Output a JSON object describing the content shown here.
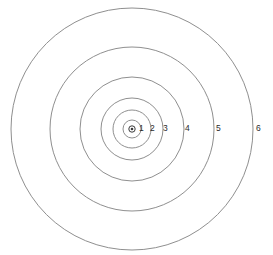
{
  "figure": {
    "background_color": "#ffffff",
    "width": 273,
    "height": 255
  },
  "style": {
    "ring_stroke_color": "#8f8f8f",
    "ring_stroke_width": 1,
    "ring_fill": "none",
    "label_color": "#2b2b2b",
    "label_font_size": 8.5,
    "center_marker_color": "#3a3a3a",
    "center_marker_fill": "#ffffff"
  },
  "chart_data": {
    "type": "scatter",
    "title": "",
    "subtitle": "",
    "xlabel": "",
    "ylabel": "",
    "grid": false,
    "legend_position": "none",
    "center": {
      "x": 132,
      "y": 129
    },
    "center_marker": {
      "label": "center-point",
      "outer_radius": 3.2,
      "inner_radius": 1.3
    },
    "rings": [
      {
        "label": "1",
        "radius": 9,
        "label_x": 139,
        "label_y": 129
      },
      {
        "label": "2",
        "radius": 19,
        "label_x": 150,
        "label_y": 129
      },
      {
        "label": "3",
        "radius": 31,
        "label_x": 163,
        "label_y": 129
      },
      {
        "label": "4",
        "radius": 52,
        "label_x": 185,
        "label_y": 129
      },
      {
        "label": "5",
        "radius": 82,
        "label_x": 216,
        "label_y": 129
      },
      {
        "label": "6",
        "radius": 121,
        "label_x": 256,
        "label_y": 129
      }
    ],
    "categories": [
      "1",
      "2",
      "3",
      "4",
      "5",
      "6"
    ],
    "values": [
      9,
      19,
      31,
      52,
      82,
      121
    ],
    "value_units": "px radius",
    "xlim": [
      12,
      253
    ],
    "ylim": [
      12,
      246
    ]
  }
}
